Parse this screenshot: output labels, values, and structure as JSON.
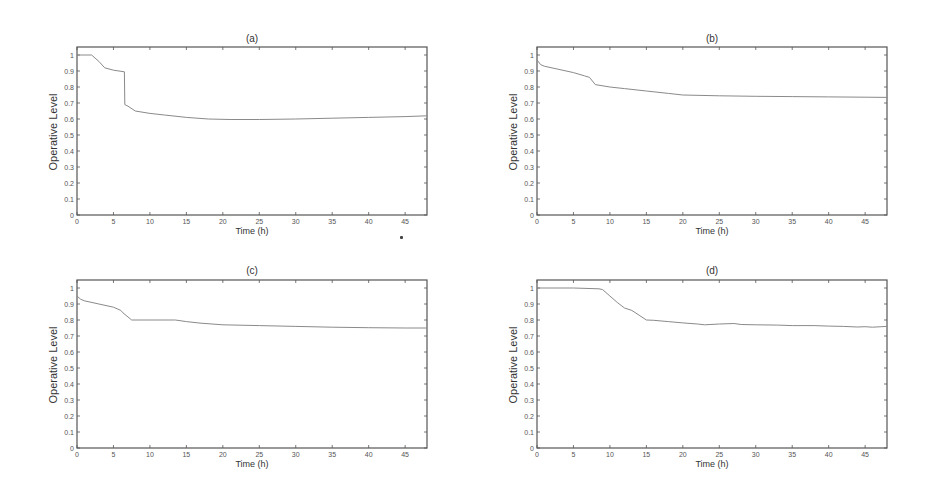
{
  "figure": {
    "panels": [
      {
        "id": "a",
        "title": "(a)",
        "xlabel": "Time (h)",
        "ylabel": "Operative Level"
      },
      {
        "id": "b",
        "title": "(b)",
        "xlabel": "Time (h)",
        "ylabel": "Operative Level"
      },
      {
        "id": "c",
        "title": "(c)",
        "xlabel": "Time (h)",
        "ylabel": "Operative Level"
      },
      {
        "id": "d",
        "title": "(d)",
        "xlabel": "Time (h)",
        "ylabel": "Operative Level"
      }
    ],
    "colors": {
      "line": "#8a8a8a",
      "axes": "#555555",
      "background": "#ffffff"
    }
  },
  "chart_data": [
    {
      "type": "line",
      "title": "(a)",
      "xlabel": "Time (h)",
      "ylabel": "Operative Level",
      "xlim": [
        0,
        48
      ],
      "ylim": [
        0,
        1.05
      ],
      "xticks": [
        0,
        5,
        10,
        15,
        20,
        25,
        30,
        35,
        40,
        45
      ],
      "yticks": [
        0,
        0.1,
        0.2,
        0.3,
        0.4,
        0.5,
        0.6,
        0.7,
        0.8,
        0.9,
        1
      ],
      "grid": false,
      "legend": null,
      "series": [
        {
          "name": "operative level",
          "x": [
            0,
            2,
            3,
            3.8,
            5,
            6.5,
            6.55,
            7,
            8,
            10,
            12,
            15,
            18,
            21,
            25,
            30,
            35,
            40,
            45,
            48
          ],
          "y": [
            1.0,
            1.0,
            0.96,
            0.92,
            0.905,
            0.895,
            0.69,
            0.68,
            0.65,
            0.635,
            0.625,
            0.61,
            0.6,
            0.597,
            0.597,
            0.6,
            0.605,
            0.61,
            0.615,
            0.62
          ]
        }
      ]
    },
    {
      "type": "line",
      "title": "(b)",
      "xlabel": "Time (h)",
      "ylabel": "Operative Level",
      "xlim": [
        0,
        48
      ],
      "ylim": [
        0,
        1.05
      ],
      "xticks": [
        0,
        5,
        10,
        15,
        20,
        25,
        30,
        35,
        40,
        45
      ],
      "yticks": [
        0,
        0.1,
        0.2,
        0.3,
        0.4,
        0.5,
        0.6,
        0.7,
        0.8,
        0.9,
        1
      ],
      "grid": false,
      "legend": null,
      "series": [
        {
          "name": "operative level",
          "x": [
            0,
            0.5,
            1,
            3,
            5,
            6.5,
            7.2,
            8,
            10,
            12,
            15,
            18,
            20,
            25,
            30,
            35,
            40,
            45,
            48
          ],
          "y": [
            0.97,
            0.94,
            0.93,
            0.91,
            0.89,
            0.87,
            0.86,
            0.815,
            0.8,
            0.79,
            0.775,
            0.76,
            0.75,
            0.745,
            0.742,
            0.74,
            0.738,
            0.736,
            0.735
          ]
        }
      ]
    },
    {
      "type": "line",
      "title": "(c)",
      "xlabel": "Time (h)",
      "ylabel": "Operative Level",
      "xlim": [
        0,
        48
      ],
      "ylim": [
        0,
        1.05
      ],
      "xticks": [
        0,
        5,
        10,
        15,
        20,
        25,
        30,
        35,
        40,
        45
      ],
      "yticks": [
        0,
        0.1,
        0.2,
        0.3,
        0.4,
        0.5,
        0.6,
        0.7,
        0.8,
        0.9,
        1
      ],
      "grid": false,
      "legend": null,
      "series": [
        {
          "name": "operative level",
          "x": [
            0,
            0.5,
            1,
            3,
            5,
            6,
            6.3,
            7.5,
            10,
            13.5,
            15,
            17,
            20,
            25,
            30,
            35,
            40,
            45,
            48
          ],
          "y": [
            0.95,
            0.93,
            0.92,
            0.9,
            0.88,
            0.86,
            0.845,
            0.8,
            0.8,
            0.8,
            0.79,
            0.78,
            0.77,
            0.765,
            0.76,
            0.755,
            0.752,
            0.75,
            0.75
          ]
        }
      ]
    },
    {
      "type": "line",
      "title": "(d)",
      "xlabel": "Time (h)",
      "ylabel": "Operative Level",
      "xlim": [
        0,
        48
      ],
      "ylim": [
        0,
        1.05
      ],
      "xticks": [
        0,
        5,
        10,
        15,
        20,
        25,
        30,
        35,
        40,
        45
      ],
      "yticks": [
        0,
        0.1,
        0.2,
        0.3,
        0.4,
        0.5,
        0.6,
        0.7,
        0.8,
        0.9,
        1
      ],
      "grid": false,
      "legend": null,
      "series": [
        {
          "name": "operative level",
          "x": [
            0,
            5,
            8.5,
            9,
            10,
            11,
            12,
            13,
            14,
            15,
            16,
            18,
            20,
            22,
            23,
            25,
            27,
            28,
            30,
            33,
            35,
            38,
            40,
            42,
            44,
            45,
            46,
            48
          ],
          "y": [
            1.0,
            1.0,
            0.995,
            0.99,
            0.95,
            0.91,
            0.875,
            0.86,
            0.83,
            0.8,
            0.798,
            0.79,
            0.782,
            0.775,
            0.77,
            0.775,
            0.778,
            0.772,
            0.77,
            0.768,
            0.765,
            0.765,
            0.762,
            0.76,
            0.756,
            0.758,
            0.755,
            0.76
          ]
        }
      ]
    }
  ]
}
